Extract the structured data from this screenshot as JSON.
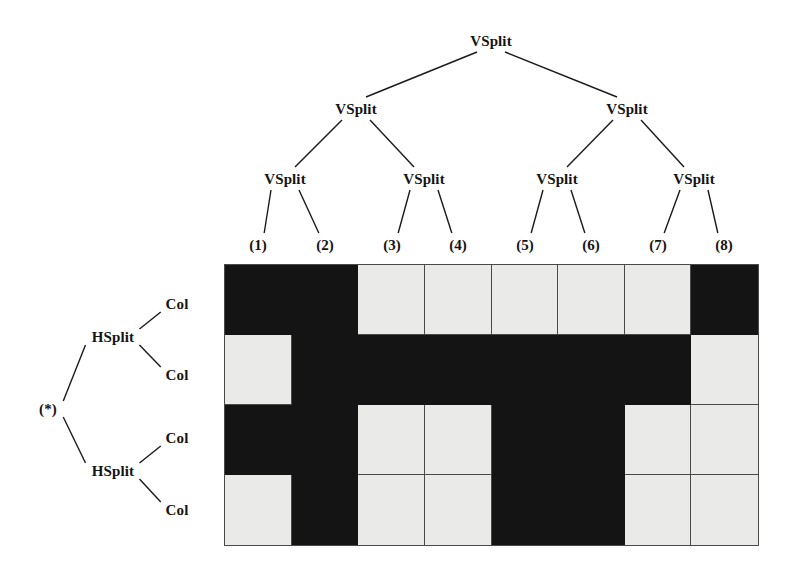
{
  "figure": {
    "width": 792,
    "height": 575,
    "background": "#ffffff",
    "ink": "#141414",
    "cell_light": "#eaeae8",
    "cell_dark": "#141414",
    "grid_line": "#4a4a4a"
  },
  "top_tree": {
    "name": "vsplit-tree",
    "orientation": "top-down",
    "nodes": [
      {
        "id": "v-root",
        "label": "VSplit",
        "x": 491,
        "y": 41
      },
      {
        "id": "v-l",
        "label": "VSplit",
        "x": 356,
        "y": 109
      },
      {
        "id": "v-r",
        "label": "VSplit",
        "x": 627,
        "y": 109
      },
      {
        "id": "v-ll",
        "label": "VSplit",
        "x": 285,
        "y": 179
      },
      {
        "id": "v-lr",
        "label": "VSplit",
        "x": 424,
        "y": 179
      },
      {
        "id": "v-rl",
        "label": "VSplit",
        "x": 557,
        "y": 179
      },
      {
        "id": "v-rr",
        "label": "VSplit",
        "x": 694,
        "y": 179
      }
    ],
    "leaves": [
      {
        "id": "leaf-1",
        "label": "(1)",
        "x": 258,
        "y": 245
      },
      {
        "id": "leaf-2",
        "label": "(2)",
        "x": 325,
        "y": 245
      },
      {
        "id": "leaf-3",
        "label": "(3)",
        "x": 392,
        "y": 245
      },
      {
        "id": "leaf-4",
        "label": "(4)",
        "x": 458,
        "y": 245
      },
      {
        "id": "leaf-5",
        "label": "(5)",
        "x": 525,
        "y": 245
      },
      {
        "id": "leaf-6",
        "label": "(6)",
        "x": 591,
        "y": 245
      },
      {
        "id": "leaf-7",
        "label": "(7)",
        "x": 658,
        "y": 245
      },
      {
        "id": "leaf-8",
        "label": "(8)",
        "x": 724,
        "y": 245
      }
    ],
    "edges": [
      {
        "from": "v-root",
        "to": "v-l"
      },
      {
        "from": "v-root",
        "to": "v-r"
      },
      {
        "from": "v-l",
        "to": "v-ll"
      },
      {
        "from": "v-l",
        "to": "v-lr"
      },
      {
        "from": "v-r",
        "to": "v-rl"
      },
      {
        "from": "v-r",
        "to": "v-rr"
      },
      {
        "from": "v-ll",
        "to": "leaf-1"
      },
      {
        "from": "v-ll",
        "to": "leaf-2"
      },
      {
        "from": "v-lr",
        "to": "leaf-3"
      },
      {
        "from": "v-lr",
        "to": "leaf-4"
      },
      {
        "from": "v-rl",
        "to": "leaf-5"
      },
      {
        "from": "v-rl",
        "to": "leaf-6"
      },
      {
        "from": "v-rr",
        "to": "leaf-7"
      },
      {
        "from": "v-rr",
        "to": "leaf-8"
      }
    ]
  },
  "left_tree": {
    "name": "hsplit-tree",
    "orientation": "left-right",
    "nodes": [
      {
        "id": "h-root",
        "label": "(*)",
        "x": 48,
        "y": 409
      },
      {
        "id": "h-top",
        "label": "HSplit",
        "x": 113,
        "y": 337
      },
      {
        "id": "h-bot",
        "label": "HSplit",
        "x": 113,
        "y": 471
      },
      {
        "id": "col-1",
        "label": "Col",
        "x": 177,
        "y": 304
      },
      {
        "id": "col-2",
        "label": "Col",
        "x": 177,
        "y": 375
      },
      {
        "id": "col-3",
        "label": "Col",
        "x": 177,
        "y": 438
      },
      {
        "id": "col-4",
        "label": "Col",
        "x": 177,
        "y": 510
      }
    ],
    "edges": [
      {
        "from": "h-root",
        "to": "h-top"
      },
      {
        "from": "h-root",
        "to": "h-bot"
      },
      {
        "from": "h-top",
        "to": "col-1"
      },
      {
        "from": "h-top",
        "to": "col-2"
      },
      {
        "from": "h-bot",
        "to": "col-3"
      },
      {
        "from": "h-bot",
        "to": "col-4"
      }
    ]
  },
  "grid": {
    "name": "layout-matrix",
    "left": 224,
    "top": 264,
    "width": 535,
    "height": 282,
    "columns": 8,
    "rows": 4,
    "legend": {
      "dark": "filled",
      "light": "empty"
    },
    "cells": [
      [
        "dark",
        "dark",
        "light",
        "light",
        "light",
        "light",
        "light",
        "dark"
      ],
      [
        "light",
        "dark",
        "dark",
        "dark",
        "dark",
        "dark",
        "dark",
        "light"
      ],
      [
        "dark",
        "dark",
        "light",
        "light",
        "dark",
        "dark",
        "light",
        "light"
      ],
      [
        "light",
        "dark",
        "light",
        "light",
        "dark",
        "dark",
        "light",
        "light"
      ]
    ]
  }
}
